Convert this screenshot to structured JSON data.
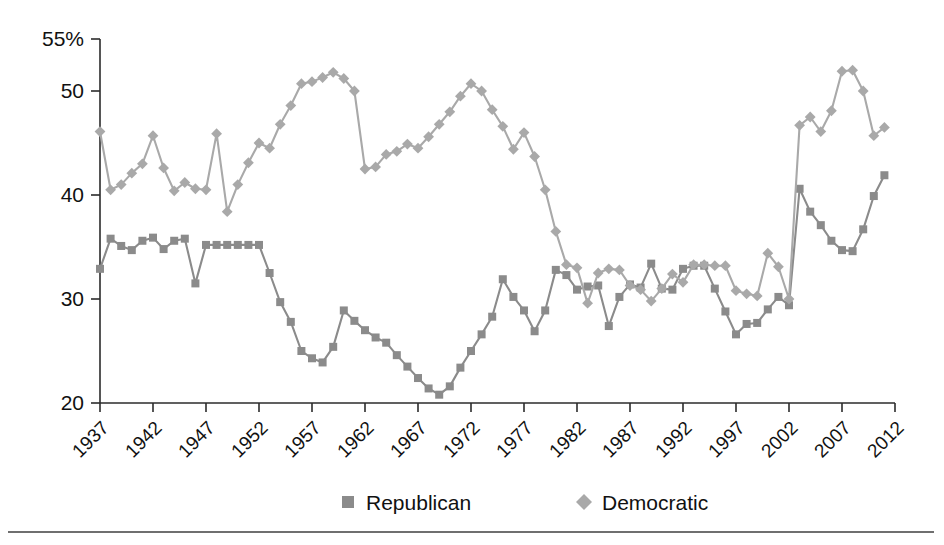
{
  "chart_data": {
    "type": "line",
    "title": "",
    "subtitle": "",
    "xlabel": "",
    "ylabel": "",
    "xlim": [
      1937,
      2012
    ],
    "ylim": [
      20,
      55
    ],
    "grid": false,
    "legend_position": "bottom-center",
    "y_ticks": [
      "55%",
      "50",
      "40",
      "30",
      "20"
    ],
    "y_tick_values": [
      55,
      50,
      40,
      30,
      20
    ],
    "x_ticks": [
      "1937",
      "1942",
      "1947",
      "1952",
      "1957",
      "1962",
      "1967",
      "1972",
      "1977",
      "1982",
      "1987",
      "1992",
      "1997",
      "2002",
      "2007",
      "2012"
    ],
    "x_tick_values": [
      1937,
      1942,
      1947,
      1952,
      1957,
      1962,
      1967,
      1972,
      1977,
      1982,
      1987,
      1992,
      1997,
      2002,
      2007,
      2012
    ],
    "x": [
      1937,
      1938,
      1939,
      1940,
      1941,
      1942,
      1943,
      1944,
      1945,
      1946,
      1947,
      1948,
      1949,
      1950,
      1951,
      1952,
      1953,
      1954,
      1955,
      1956,
      1957,
      1958,
      1959,
      1960,
      1961,
      1962,
      1963,
      1964,
      1965,
      1966,
      1967,
      1968,
      1969,
      1970,
      1971,
      1972,
      1973,
      1974,
      1975,
      1976,
      1977,
      1978,
      1979,
      1980,
      1981,
      1982,
      1983,
      1984,
      1985,
      1986,
      1987,
      1988,
      1989,
      1990,
      1991,
      1992,
      1993,
      1994,
      1995,
      1996,
      1997,
      1998,
      1999,
      2000,
      2001,
      2002,
      2003,
      2004,
      2005,
      2006,
      2007,
      2008,
      2009,
      2010,
      2011
    ],
    "series": [
      {
        "name": "Republican",
        "marker": "square",
        "color": "#8b8b8b",
        "values": [
          32.9,
          35.8,
          35.1,
          34.7,
          35.6,
          35.9,
          34.8,
          35.6,
          35.8,
          31.5,
          35.2,
          35.2,
          35.2,
          35.2,
          35.2,
          35.2,
          32.5,
          29.7,
          27.8,
          25.0,
          24.3,
          23.9,
          25.4,
          28.9,
          27.9,
          27.0,
          26.3,
          25.8,
          24.6,
          23.5,
          22.4,
          21.4,
          20.8,
          21.6,
          23.4,
          25.0,
          26.6,
          28.3,
          31.9,
          30.2,
          28.9,
          26.9,
          28.9,
          32.8,
          32.3,
          30.9,
          31.2,
          31.3,
          27.4,
          30.2,
          31.4,
          31.1,
          33.4,
          31.0,
          30.9,
          32.9,
          33.2,
          33.2,
          31.0,
          28.8,
          26.6,
          27.6,
          27.7,
          29.0,
          30.2,
          29.4,
          40.6,
          38.4,
          37.1,
          35.6,
          34.7,
          34.6,
          36.7,
          39.9,
          41.9
        ]
      },
      {
        "name": "Democratic",
        "marker": "diamond",
        "color": "#a9a9a9",
        "values": [
          46.1,
          40.5,
          41.0,
          42.1,
          43.0,
          45.7,
          42.6,
          40.4,
          41.2,
          40.6,
          40.5,
          45.9,
          38.4,
          41.0,
          43.1,
          45.0,
          44.5,
          46.8,
          48.6,
          50.7,
          50.9,
          51.3,
          51.8,
          51.2,
          50.0,
          42.5,
          42.7,
          43.9,
          44.2,
          44.9,
          44.5,
          45.6,
          46.8,
          48.0,
          49.5,
          50.7,
          50.0,
          48.2,
          46.6,
          44.4,
          46.0,
          43.7,
          40.5,
          36.5,
          33.3,
          33.0,
          29.6,
          32.5,
          32.9,
          32.8,
          31.3,
          30.9,
          29.8,
          31.0,
          32.4,
          31.6,
          33.3,
          33.3,
          33.2,
          33.2,
          30.8,
          30.5,
          30.3,
          34.4,
          33.1,
          30.0,
          46.7,
          47.5,
          46.1,
          48.1,
          51.9,
          52.0,
          50.0,
          45.7,
          46.5
        ]
      }
    ]
  },
  "legend": {
    "items": [
      {
        "label": "Republican",
        "color": "#8b8b8b",
        "marker": "square"
      },
      {
        "label": "Democratic",
        "color": "#a9a9a9",
        "marker": "diamond"
      }
    ]
  },
  "axis": {
    "y_unit_suffix": "%",
    "x_label_rotation": "-45"
  }
}
